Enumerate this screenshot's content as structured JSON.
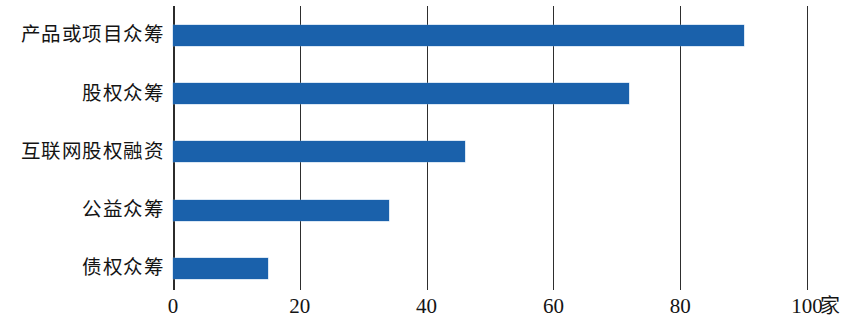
{
  "chart_data": {
    "type": "bar",
    "orientation": "horizontal",
    "title": "",
    "xlabel": "家",
    "ylabel": "",
    "categories": [
      "产品或项目众筹",
      "股权众筹",
      "互联网股权融资",
      "公益众筹",
      "债权众筹"
    ],
    "values": [
      90,
      72,
      46,
      34,
      15
    ],
    "xticks": [
      "0",
      "20",
      "40",
      "60",
      "80",
      "100"
    ],
    "xtick_values": [
      0,
      20,
      40,
      60,
      80,
      100
    ],
    "xlim": [
      0,
      100
    ],
    "grid": true,
    "grid_axis": "x",
    "legend": false,
    "bar_color": "#1a61ab",
    "axis_color": "#2b2b2b",
    "unit": "家"
  }
}
